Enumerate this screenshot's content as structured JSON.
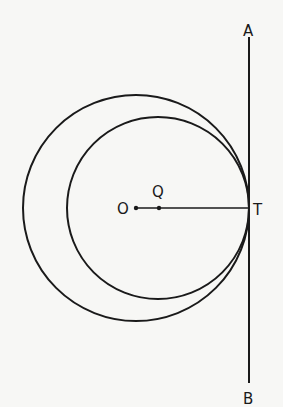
{
  "diagram": {
    "type": "geometry",
    "colors": {
      "stroke": "#1a1a1a",
      "background": "#f7f7f5"
    },
    "points": {
      "O": {
        "label": "O",
        "x": 136,
        "y": 208
      },
      "Q": {
        "label": "Q",
        "x": 159,
        "y": 208
      },
      "T": {
        "label": "T",
        "x": 249,
        "y": 208
      },
      "A": {
        "label": "A",
        "x": 249,
        "y": 37
      },
      "B": {
        "label": "B",
        "x": 249,
        "y": 397
      }
    },
    "circles": [
      {
        "name": "outer-circle",
        "center": "O",
        "cx": 136,
        "cy": 208,
        "r": 113
      },
      {
        "name": "inner-circle",
        "center": "Q",
        "cx": 158,
        "cy": 208,
        "r": 91
      }
    ],
    "segments": [
      {
        "name": "tangent-line-AB",
        "from": "A",
        "to": "B"
      },
      {
        "name": "segment-OT",
        "from": "O",
        "to": "T"
      }
    ]
  }
}
